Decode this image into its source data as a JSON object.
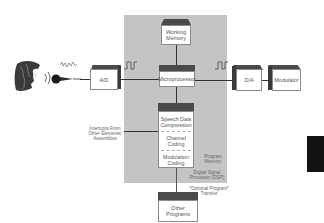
{
  "diagram": {
    "source": {
      "face_icon": "speaking-head",
      "microphone_icon": "microphone",
      "analog_wave": "analog-waveform"
    },
    "blocks": {
      "ad": "A/D",
      "working_memory": [
        "Working",
        "Memory"
      ],
      "microprocessor": "Microprocessor",
      "da": "D/A",
      "modulator": "Modulator",
      "program_memory_sections": [
        [
          "Speech Data",
          "Compression"
        ],
        [
          "Channel",
          "Coding"
        ],
        [
          "Modulation",
          "Coding"
        ]
      ],
      "other_programs": [
        "Other",
        "Programs"
      ]
    },
    "annotations": {
      "interrupts": [
        "Interrupts From",
        "Other Elements/",
        "Assemblies"
      ],
      "program_memory": [
        "Program",
        "Memory"
      ],
      "dsp": [
        "Digital Signal",
        "Processor (DSP)"
      ],
      "optional_transfer": [
        "*Optional Program*",
        "Transfer"
      ]
    },
    "signals": {
      "digital_wave_1": "square-wave",
      "digital_wave_2": "square-wave"
    },
    "colors": {
      "panel": "#c4c4c4",
      "box_top": "#4a4a4a",
      "box_face": "#ffffff",
      "line": "#333333",
      "black_bar": "#111111"
    }
  }
}
